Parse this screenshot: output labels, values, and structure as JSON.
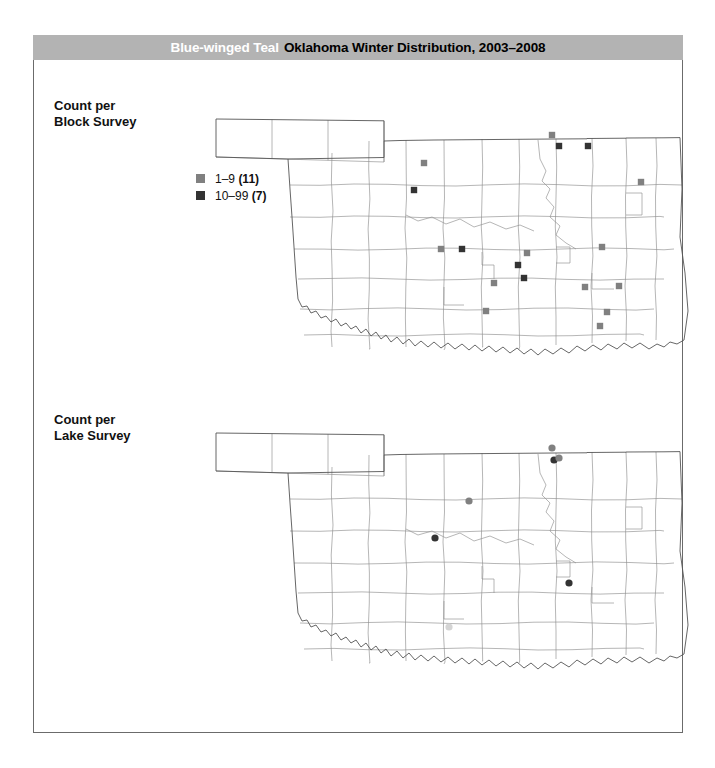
{
  "title": {
    "species": "Blue-winged Teal",
    "rest": "Oklahoma Winter Distribution, 2003–2008"
  },
  "colors": {
    "title_bar": "#b3b3b3",
    "species_text": "#ffffff",
    "title_text": "#000000",
    "frame_border": "#6b6b6b",
    "county_stroke": "#8e8e8e",
    "state_stroke": "#555555",
    "class_low": "#808080",
    "class_mid": "#333333",
    "class_high": "#d4d4d4"
  },
  "panels": [
    {
      "id": "block",
      "label_line1": "Count per",
      "label_line2": "Block Survey",
      "marker_shape": "square",
      "legend": [
        {
          "range": "1–9",
          "count": "(11)",
          "color": "#808080"
        },
        {
          "range": "10–99",
          "count": "(7)",
          "color": "#333333"
        }
      ],
      "markers": [
        {
          "x": 230,
          "y": 66,
          "cls": "low"
        },
        {
          "x": 220,
          "y": 93,
          "cls": "mid"
        },
        {
          "x": 358,
          "y": 38,
          "cls": "low"
        },
        {
          "x": 365,
          "y": 49,
          "cls": "mid"
        },
        {
          "x": 394,
          "y": 49,
          "cls": "mid"
        },
        {
          "x": 447,
          "y": 85,
          "cls": "low"
        },
        {
          "x": 247,
          "y": 152,
          "cls": "low"
        },
        {
          "x": 268,
          "y": 152,
          "cls": "mid"
        },
        {
          "x": 408,
          "y": 150,
          "cls": "low"
        },
        {
          "x": 391,
          "y": 190,
          "cls": "low"
        },
        {
          "x": 425,
          "y": 189,
          "cls": "low"
        },
        {
          "x": 413,
          "y": 215,
          "cls": "low"
        },
        {
          "x": 406,
          "y": 229,
          "cls": "low"
        },
        {
          "x": 324,
          "y": 168,
          "cls": "mid"
        },
        {
          "x": 330,
          "y": 181,
          "cls": "mid"
        },
        {
          "x": 333,
          "y": 156,
          "cls": "low"
        },
        {
          "x": 300,
          "y": 186,
          "cls": "low"
        },
        {
          "x": 292,
          "y": 214,
          "cls": "low"
        }
      ]
    },
    {
      "id": "lake",
      "label_line1": "Count per",
      "label_line2": "Lake Survey",
      "marker_shape": "circle",
      "legend": [
        {
          "range": "1–9",
          "count": "(5)",
          "color": "#808080"
        },
        {
          "range": "10–99",
          "count": "(2)",
          "color": "#333333"
        },
        {
          "range": "100–999",
          "count": "(1)",
          "color": "#d4d4d4"
        }
      ],
      "markers": [
        {
          "x": 358,
          "y": 37,
          "cls": "low"
        },
        {
          "x": 360,
          "y": 49,
          "cls": "mid"
        },
        {
          "x": 365,
          "y": 47,
          "cls": "low"
        },
        {
          "x": 275,
          "y": 90,
          "cls": "low"
        },
        {
          "x": 241,
          "y": 127,
          "cls": "mid"
        },
        {
          "x": 375,
          "y": 172,
          "cls": "mid"
        },
        {
          "x": 255,
          "y": 216,
          "cls": "high"
        }
      ]
    }
  ]
}
